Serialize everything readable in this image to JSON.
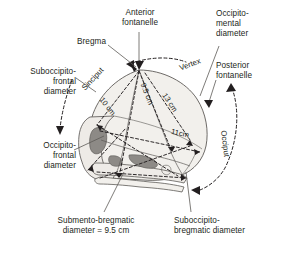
{
  "figure": {
    "type": "anatomical-diagram"
  },
  "labels": {
    "anterior_fontanelle": "Anterior\nfontanelle",
    "bregma": "Bregma",
    "occipito_mental_diameter": "Occipito-\nmental\ndiameter",
    "posterior_fontanelle": "Posterior\nfontanelle",
    "suboccipito_frontal_diameter": "Suboccipito-\nfrontal\ndiameter",
    "occipito_frontal_diameter": "Occipito-\nfrontal\ndiameter",
    "submento_bregmatic_diameter": "Submento-bregmatic\ndiameter = 9.5 cm",
    "suboccipito_bregmatic_diameter": "Suboccipito-\nbregmatic diameter"
  },
  "regions": {
    "sinciput": "Sinciput",
    "vertex": "Vertex",
    "occiput": "Occiput"
  },
  "measurements": {
    "suboccipito_frontal": "10 cm",
    "suboccipito_bregmatic": "9.5 cm",
    "occipito_frontal": "11cm",
    "occipito_mental": "13 cm"
  },
  "colors": {
    "ink": "#231f20",
    "skull_fill": "#f2f0ec",
    "bone_shade": "#d8d5d0",
    "bone_dark": "#8d8a86",
    "dashed": "#231f20"
  }
}
